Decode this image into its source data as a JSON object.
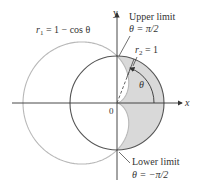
{
  "figure": {
    "type": "polar-region",
    "curves": [
      {
        "name": "cardioid",
        "label": "r₁ = 1 − cos θ",
        "equation": "r = 1 - cos(theta)",
        "color": "#b8b8b8"
      },
      {
        "name": "unit-circle",
        "label": "r₂ = 1",
        "equation": "r = 1",
        "color": "#555555"
      }
    ],
    "region": {
      "description": "inside r2 = 1 and outside r1 = 1 - cos theta",
      "fill": "#d9d9d9"
    },
    "axes": {
      "x_label": "x",
      "y_label": "y",
      "origin_label": "0"
    },
    "angle_label": "θ",
    "annotations": {
      "upper_title": "Upper limit",
      "upper_value": "θ = π/2",
      "lower_title": "Lower limit",
      "lower_value": "θ = −π/2"
    }
  },
  "labels": {
    "r1_prefix": "r",
    "r1_sub": "1",
    "r1_rest": " = 1 − cos θ",
    "r2_prefix": "r",
    "r2_sub": "2",
    "r2_rest": " = 1"
  }
}
